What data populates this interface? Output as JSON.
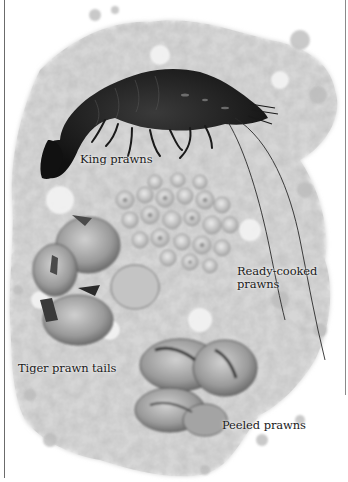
{
  "figure": {
    "colors": {
      "background": "#ffffff",
      "ice_light": "#e8e8e8",
      "ice_mid": "#bdbdbd",
      "ice_dark": "#8c8c8c",
      "king_prawn": "#1e1e1e",
      "label_text": "#1a1a1a",
      "rule": "#6b6b6b"
    },
    "labels": [
      {
        "id": "king",
        "text": "King prawns"
      },
      {
        "id": "ready",
        "line1": "Ready-cooked",
        "line2": "prawns"
      },
      {
        "id": "tiger",
        "text": "Tiger prawn tails"
      },
      {
        "id": "peeled",
        "text": "Peeled prawns"
      }
    ]
  }
}
